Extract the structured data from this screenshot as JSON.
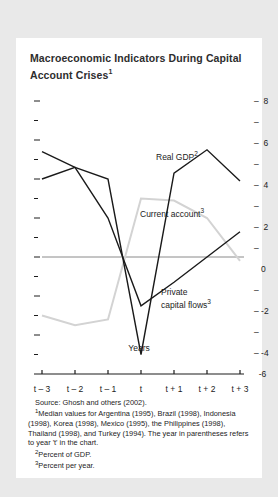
{
  "title": "Macroeconomic Indicators During Capital Account Crises",
  "title_footnote_marker": "1",
  "colors": {
    "real_gdp": "#1a1a1a",
    "private_capital_flows": "#1a1a1a",
    "current_account": "#d3d3d3",
    "axis": "#555555",
    "zero_line": "#8a8a8a",
    "background": "#ffffff",
    "page_background": "#e9e9e9",
    "text": "#1c1c1c"
  },
  "series_labels": {
    "real_gdp": "Real GDP",
    "real_gdp_marker": "2",
    "current_account": "Current account",
    "current_account_marker": "3",
    "private_capital_flows_line1": "Private",
    "private_capital_flows_line2": "capital flows",
    "private_capital_flows_marker": "3"
  },
  "notes": {
    "source": "Source: Ghosh and others (2002).",
    "note1_marker": "1",
    "note1": "Median values for Argentina (1995), Brazil (1998), Indonesia (1998), Korea (1998), Mexico (1995), the Philippines (1998), Thailand (1998), and Turkey (1994). The year in parentheses refers to year 't' in the chart.",
    "note2_marker": "2",
    "note2": "Percent of GDP.",
    "note3_marker": "3",
    "note3": "Percent per year."
  },
  "chart_data": {
    "type": "line",
    "title": "Macroeconomic Indicators During Capital Account Crises",
    "xlabel": "Years",
    "ylabel": "",
    "x": [
      "t – 3",
      "t – 2",
      "t – 1",
      "t",
      "t + 1",
      "t + 2",
      "t + 3"
    ],
    "ylim": [
      -6,
      8
    ],
    "yticks_major": [
      8,
      6,
      4,
      2,
      0,
      -2,
      -4,
      -6
    ],
    "yticks_minor": [
      7,
      5,
      3,
      1,
      -1,
      -3,
      -5
    ],
    "grid": false,
    "zero_line": true,
    "legend": "inline-annotations",
    "series": [
      {
        "name": "Real GDP",
        "unit": "Percent of GDP",
        "color": "#1a1a1a",
        "values": [
          5.4,
          4.6,
          4.0,
          -5.0,
          4.3,
          5.5,
          3.9
        ]
      },
      {
        "name": "Private capital flows",
        "unit": "Percent per year",
        "color": "#1a1a1a",
        "values": [
          4.0,
          4.6,
          2.0,
          -2.5,
          -1.3,
          0.0,
          1.3
        ]
      },
      {
        "name": "Current account",
        "unit": "Percent per year",
        "color": "#d3d3d3",
        "values": [
          -3.0,
          -3.5,
          -3.2,
          3.0,
          2.9,
          2.0,
          -0.2
        ]
      }
    ]
  }
}
